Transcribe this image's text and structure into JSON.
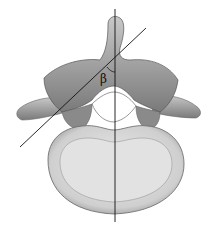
{
  "diagram": {
    "angle_label": "β",
    "lines": [
      {
        "name": "midsagittal-line",
        "description": "vertical reference line through spinous process and vertebral body"
      },
      {
        "name": "pedicle-axis-line",
        "description": "oblique line along pedicle axis"
      }
    ],
    "colors": {
      "bone_dark": "#6e6e6e",
      "bone_mid": "#a8a8a8",
      "bone_light": "#d8d8d8",
      "line": "#111111"
    }
  }
}
